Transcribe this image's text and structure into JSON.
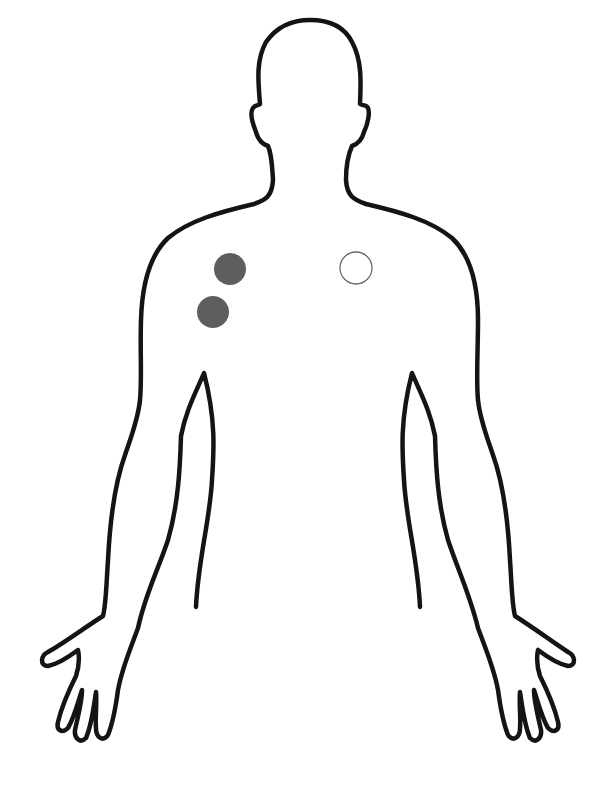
{
  "diagram": {
    "colors": {
      "background": "#ffffff",
      "outline": "#141414",
      "filled_marker": "#5e5e5e",
      "open_marker_stroke": "#6a6a6a"
    },
    "markers": [
      {
        "id": "left-shoulder-upper",
        "type": "filled",
        "cx": 230,
        "cy": 269,
        "r": 16
      },
      {
        "id": "left-shoulder-lower",
        "type": "filled",
        "cx": 213,
        "cy": 312,
        "r": 16
      },
      {
        "id": "right-shoulder",
        "type": "open",
        "cx": 356,
        "cy": 268,
        "r": 16
      }
    ]
  }
}
